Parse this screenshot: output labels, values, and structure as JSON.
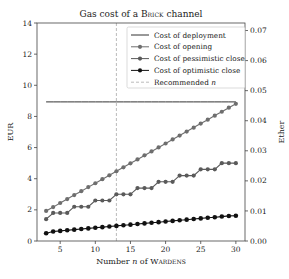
{
  "chart_data": {
    "type": "line",
    "title": "Gas cost of a BRICK channel",
    "title_parts": {
      "prefix": "Gas cost of a ",
      "smallcaps": "Brick",
      "suffix": " channel"
    },
    "xlabel": "Number n of WARDENS",
    "xlabel_parts": {
      "prefix": "Number ",
      "var": "n",
      "middle": " of ",
      "smallcaps": "Wardens"
    },
    "ylabel": "EUR",
    "ylabel_right": "Ether",
    "xlim": [
      1.7,
      31.3
    ],
    "ylim": [
      0,
      14
    ],
    "ylim_right": [
      0,
      0.0725
    ],
    "xticks": [
      5,
      10,
      15,
      20,
      25,
      30
    ],
    "yticks": [
      0,
      2,
      4,
      6,
      8,
      10,
      12,
      14
    ],
    "yticks_right": [
      "0.00",
      "0.01",
      "0.02",
      "0.03",
      "0.04",
      "0.05",
      "0.06",
      "0.07"
    ],
    "grid": false,
    "legend_position": "upper right",
    "x": [
      3,
      4,
      5,
      6,
      7,
      8,
      9,
      10,
      11,
      12,
      13,
      14,
      15,
      16,
      17,
      18,
      19,
      20,
      21,
      22,
      23,
      24,
      25,
      26,
      27,
      28,
      29,
      30
    ],
    "series": [
      {
        "name": "Cost of deployment",
        "style": "line",
        "color": "#333333",
        "values": [
          8.93,
          8.93,
          8.93,
          8.93,
          8.93,
          8.93,
          8.93,
          8.93,
          8.93,
          8.93,
          8.93,
          8.93,
          8.93,
          8.93,
          8.93,
          8.93,
          8.93,
          8.93,
          8.93,
          8.93,
          8.93,
          8.93,
          8.93,
          8.93,
          8.93,
          8.93,
          8.93,
          8.93
        ]
      },
      {
        "name": "Cost of opening",
        "style": "line-marker",
        "color": "#6e6e6e",
        "values": [
          1.93,
          2.18,
          2.44,
          2.69,
          2.95,
          3.2,
          3.46,
          3.71,
          3.97,
          4.22,
          4.48,
          4.73,
          4.99,
          5.24,
          5.5,
          5.75,
          6.01,
          6.26,
          6.52,
          6.77,
          7.03,
          7.28,
          7.54,
          7.79,
          8.05,
          8.3,
          8.56,
          8.81
        ]
      },
      {
        "name": "Cost of pessimistic close",
        "style": "line-marker",
        "color": "#5a5a5a",
        "values": [
          1.4,
          1.8,
          1.8,
          1.8,
          2.2,
          2.2,
          2.2,
          2.6,
          2.6,
          2.6,
          3.0,
          3.0,
          3.0,
          3.4,
          3.4,
          3.4,
          3.8,
          3.8,
          3.8,
          4.2,
          4.2,
          4.2,
          4.6,
          4.6,
          4.6,
          5.0,
          5.0,
          5.0
        ]
      },
      {
        "name": "Cost of optimistic close",
        "style": "line-marker",
        "color": "#111111",
        "values": [
          0.5,
          0.61,
          0.65,
          0.69,
          0.73,
          0.77,
          0.81,
          0.85,
          0.89,
          0.93,
          0.97,
          1.01,
          1.05,
          1.09,
          1.13,
          1.17,
          1.21,
          1.25,
          1.29,
          1.33,
          1.37,
          1.41,
          1.45,
          1.49,
          1.53,
          1.57,
          1.61,
          1.62
        ]
      }
    ],
    "annotations": [
      {
        "type": "vline",
        "x": 13,
        "label": "Recommended n",
        "style": "dashed",
        "color": "#aaaaaa"
      }
    ]
  },
  "legend": {
    "items": [
      {
        "label": "Cost of deployment",
        "kind": "line",
        "color": "#333333"
      },
      {
        "label": "Cost of opening",
        "kind": "marker",
        "color": "#6e6e6e"
      },
      {
        "label": "Cost of pessimistic close",
        "kind": "marker",
        "color": "#5a5a5a"
      },
      {
        "label": "Cost of optimistic close",
        "kind": "marker",
        "color": "#111111"
      },
      {
        "label": "Recommended n",
        "kind": "dashed",
        "color": "#aaaaaa"
      }
    ]
  }
}
